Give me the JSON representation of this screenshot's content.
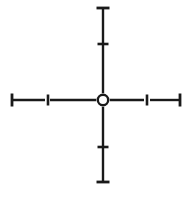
{
  "figure": {
    "name": "crosshair-reticle",
    "width": 194,
    "height": 197,
    "background_color": "#ffffff",
    "ink_color": "#1a1a1a",
    "style": "engraved line drawing"
  },
  "chart_data": {
    "type": "diagram",
    "xlabel": "",
    "ylabel": "",
    "xlim": [
      0,
      194
    ],
    "ylim": [
      0,
      197
    ],
    "grid": false,
    "legend": "none",
    "center": {
      "x": 103,
      "y": 100,
      "radius": 5.2,
      "fill": "none"
    },
    "series": [
      {
        "name": "vertical-stem",
        "type": "line",
        "x": [
          103,
          103
        ],
        "y": [
          8,
          182
        ],
        "stroke_width": 2.4
      },
      {
        "name": "horizontal-stem",
        "type": "line",
        "x": [
          12,
          180
        ],
        "y": [
          100,
          100
        ],
        "stroke_width": 2.4
      }
    ],
    "end_caps": [
      {
        "name": "top-end-cap",
        "axis": "vertical",
        "x": 103,
        "y": 8,
        "length": 13,
        "orientation": "horizontal",
        "stroke_width": 2.8
      },
      {
        "name": "bottom-end-cap",
        "axis": "vertical",
        "x": 103,
        "y": 182,
        "length": 13,
        "orientation": "horizontal",
        "stroke_width": 2.8
      },
      {
        "name": "left-end-cap",
        "axis": "horizontal",
        "x": 12,
        "y": 100,
        "length": 13,
        "orientation": "vertical",
        "stroke_width": 2.8
      },
      {
        "name": "right-end-cap",
        "axis": "horizontal",
        "x": 180,
        "y": 100,
        "length": 13,
        "orientation": "vertical",
        "stroke_width": 2.8
      }
    ],
    "tick_marks": [
      {
        "name": "upper-tick",
        "axis": "vertical",
        "x": 103,
        "y": 44,
        "length": 11,
        "orientation": "horizontal",
        "stroke_width": 2.6
      },
      {
        "name": "lower-tick",
        "axis": "vertical",
        "x": 103,
        "y": 147,
        "length": 11,
        "orientation": "horizontal",
        "stroke_width": 2.6
      },
      {
        "name": "left-tick",
        "axis": "horizontal",
        "x": 48,
        "y": 100,
        "length": 11,
        "orientation": "vertical",
        "stroke_width": 2.6
      },
      {
        "name": "right-tick",
        "axis": "horizontal",
        "x": 147,
        "y": 100,
        "length": 11,
        "orientation": "vertical",
        "stroke_width": 2.6
      }
    ],
    "gaps": [
      {
        "name": "left-arm-gap",
        "x_start": 45,
        "x_end": 50,
        "y": 100
      },
      {
        "name": "right-arm-gap",
        "x_start": 144,
        "x_end": 150,
        "y": 100
      }
    ],
    "annotations": []
  }
}
